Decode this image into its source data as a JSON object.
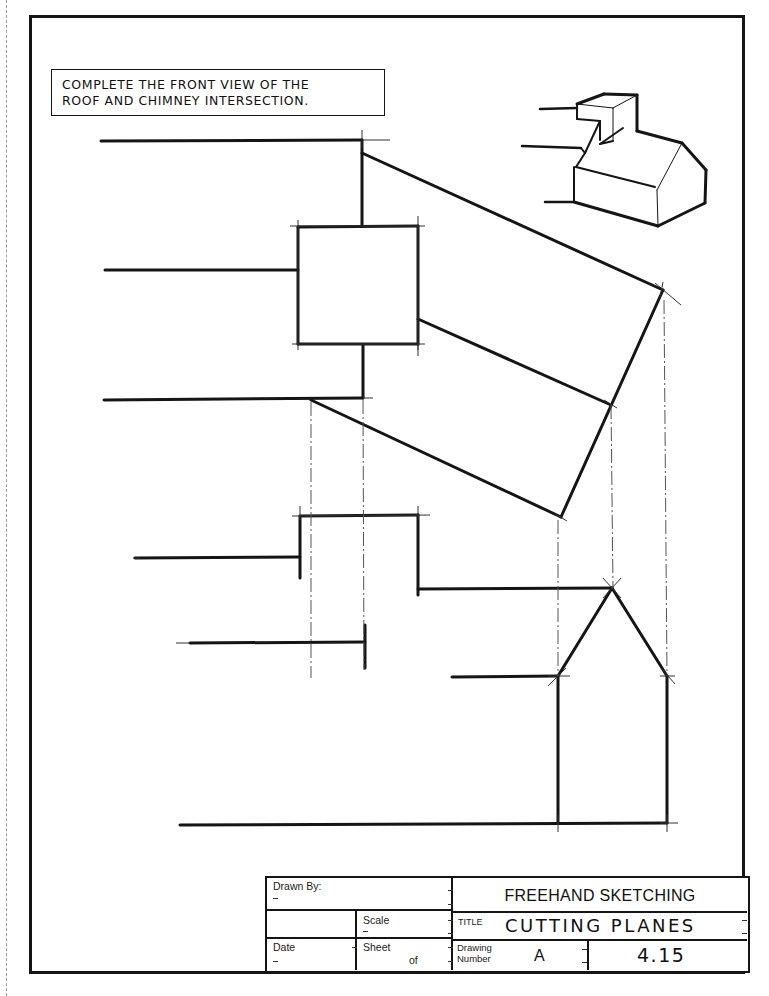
{
  "instruction": {
    "line1": "COMPLETE THE FRONT VIEW OF THE",
    "line2": "ROOF AND CHIMNEY INTERSECTION."
  },
  "drawing": {
    "top_view": "chimney-and-roof-top-view",
    "side_view": "roof-incline-auxiliary-view",
    "front_view": "incomplete-front-view",
    "right_view": "gable-end-view",
    "pictorial": "isometric-house-with-chimney"
  },
  "title_block": {
    "drawn_by_label": "Drawn By:",
    "scale_label": "Scale",
    "date_label": "Date",
    "sheet_label": "Sheet",
    "of_label": "of",
    "course": "FREEHAND SKETCHING",
    "title_label": "TITLE",
    "title": "CUTTING PLANES",
    "drawing_number_label_1": "Drawing",
    "drawing_number_label_2": "Number",
    "drawing_letter": "A",
    "drawing_number": "4.15"
  },
  "colors": {
    "ink": "#151515",
    "paper": "#ffffff",
    "construction": "#555555"
  }
}
